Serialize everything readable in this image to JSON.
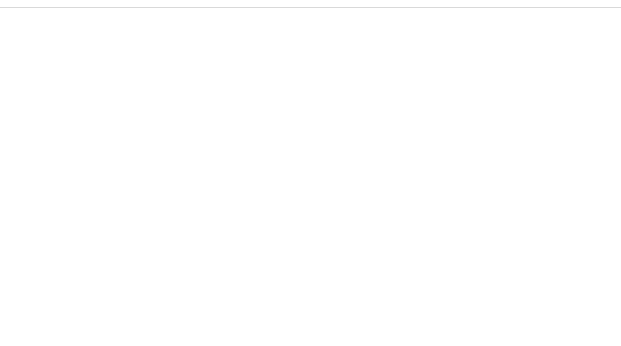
{
  "chart_data": {
    "type": "bar",
    "title": "",
    "xlabel": "Country rank",
    "ylabel": "",
    "header": "Country rank",
    "rank_max": 32,
    "bar_scale_px": 350,
    "legend": [
      {
        "key": "status",
        "label": "Status"
      },
      {
        "key": "progress",
        "label": "Progress"
      }
    ],
    "groups": [
      {
        "name": "Greenhouse gases",
        "rows": [
          {
            "label": "emissions/cap. (29)",
            "count": 29,
            "rank": 1,
            "value": "1",
            "type": "status",
            "italic": false
          },
          {
            "label": "emissions/GDP (28)",
            "count": 28,
            "rank": 15,
            "value": "15",
            "type": "status",
            "italic": false
          },
          {
            "label": "emissions DTT (23)",
            "count": 23,
            "rank": 1,
            "value": "1",
            "type": "progress",
            "italic": false
          }
        ]
      },
      {
        "name": "Energy consumption",
        "rows": [
          {
            "label": "consumption/cap. (30)",
            "count": 30,
            "rank": 3,
            "value": "3",
            "type": "status",
            "italic": false
          },
          {
            "label": "consumption/GDP (30)",
            "count": 30,
            "rank": 20,
            "value": "20",
            "type": "status",
            "italic": false
          },
          {
            "label": "consumption (30)",
            "count": 30,
            "rank": 2,
            "value": "2",
            "type": "progress",
            "italic": false
          }
        ]
      },
      {
        "name": "Renewables in electricity",
        "rows": [
          {
            "label": "share (30)",
            "count": 30,
            "rank": 22,
            "value": "22",
            "type": "status",
            "italic": false
          },
          {
            "label": "share (30)",
            "count": 30,
            "rank": 20,
            "value": "20",
            "type": "progress",
            "italic": false
          }
        ]
      },
      {
        "name": "Acidifying substances",
        "rows": [
          {
            "label": "emissions/cap. (30)",
            "count": 30,
            "rank": 2,
            "value": "2",
            "type": "status",
            "italic": false
          },
          {
            "label": "emissions DTT (28)",
            "count": 28,
            "rank": 1,
            "value": "1",
            "type": "progress",
            "italic": false
          }
        ]
      },
      {
        "name": "Ozone precursors",
        "rows": [
          {
            "label": "emissions/cap. (30)",
            "count": 30,
            "rank": 23,
            "value": "23",
            "type": "status",
            "italic": false
          },
          {
            "label": "emissions (30)",
            "count": 30,
            "rank": 7,
            "value": "7",
            "type": "progress",
            "italic": false
          },
          {
            "label": "emissions DTT (28)",
            "count": 28,
            "rank": 2,
            "value": "2",
            "type": "progress",
            "italic": false
          }
        ]
      },
      {
        "name": "Freight transport",
        "rows": [
          {
            "label": "freight transport/cap. (30)",
            "count": 30,
            "rank": 28,
            "value": "28",
            "type": "status",
            "italic": false
          },
          {
            "label": "freight transport/GDP (30)",
            "count": 30,
            "rank": 30,
            "value": "30",
            "type": "status",
            "italic": false
          },
          {
            "label": "freight transport (30)",
            "count": 30,
            "rank": 28,
            "value": "28",
            "type": "progress",
            "italic": false
          }
        ]
      },
      {
        "name": "Organic farming",
        "rows": [
          {
            "label": "share (32)",
            "count": 32,
            "rank": 23,
            "value": "23",
            "type": "status",
            "italic": false
          },
          {
            "label": "share (32)",
            "count": 32,
            "rank": 23,
            "value": "23",
            "type": "progress",
            "italic": false
          }
        ]
      },
      {
        "name": "Municipal waste",
        "rows": [
          {
            "label": "generation/cap. (30)",
            "count": 30,
            "rank": 6,
            "value": "6",
            "type": "status",
            "italic": false
          },
          {
            "label": "generation (30)",
            "count": 30,
            "rank": 23,
            "value": "23",
            "type": "progress",
            "italic": true
          }
        ]
      },
      {
        "name": "Fresh water use",
        "rows": [
          {
            "label": "water exploitation index (28)",
            "count": 28,
            "rank": 2,
            "value": "2",
            "type": "status",
            "italic": false
          },
          {
            "label": "water exploitation index (25)",
            "count": 25,
            "rank": 13,
            "value": "13",
            "type": "progress",
            "italic": false
          }
        ]
      }
    ]
  },
  "colors": {
    "status_fill": "#c4c4c4",
    "status_border": "#a8a8a8",
    "progress_border": "#bdbdbd",
    "progress_pattern": "#c9c9c9",
    "text": "#4d4d4d",
    "separator": "#cfcfcf"
  }
}
